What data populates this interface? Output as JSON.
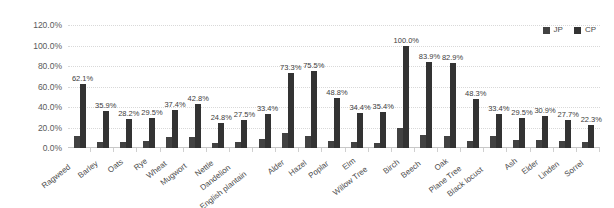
{
  "chart_data": {
    "type": "bar",
    "title": "",
    "subtitle": "",
    "xlabel": "",
    "ylabel": "",
    "ylim": [
      0,
      120
    ],
    "ytick_labels": [
      "120.0%",
      "100.0%",
      "80.0%",
      "60.0%",
      "40.0%",
      "20.0%",
      "0.0%"
    ],
    "ytick_values": [
      120,
      100,
      80,
      60,
      40,
      20,
      0
    ],
    "grid": true,
    "legend_position": "top-right",
    "orientation": "vertical",
    "value_labels_series": "CP",
    "categories": [
      "Ragweed",
      "Barley",
      "Oats",
      "Rye",
      "Wheat",
      "Mugwort",
      "Nettle",
      "Dandelion",
      "English plantain",
      "Alder",
      "Hazel",
      "Poplar",
      "Elm",
      "Willow Tree",
      "Birch",
      "Beech",
      "Oak",
      "Plane Tree",
      "Black locust",
      "Ash",
      "Elder",
      "Linden",
      "Sorrel"
    ],
    "series": [
      {
        "name": "JP",
        "color": "#424242",
        "values": [
          12.0,
          6.2,
          6.0,
          6.8,
          10.4,
          11.2,
          5.0,
          6.0,
          8.5,
          15.0,
          11.5,
          6.5,
          5.8,
          5.2,
          19.8,
          13.0,
          12.2,
          7.2,
          11.6,
          7.5,
          8.0,
          7.0,
          5.5
        ],
        "labels_shown": false
      },
      {
        "name": "CP",
        "color": "#333333",
        "values": [
          62.1,
          35.9,
          28.2,
          29.5,
          37.4,
          42.8,
          24.8,
          27.5,
          33.4,
          73.3,
          75.5,
          48.8,
          34.4,
          35.4,
          100.0,
          83.9,
          82.9,
          48.3,
          33.4,
          29.5,
          30.9,
          27.7,
          22.3
        ],
        "value_labels": [
          "62.1%",
          "35.9%",
          "28.2%",
          "29.5%",
          "37.4%",
          "42.8%",
          "24.8%",
          "27.5%",
          "33.4%",
          "73.3%",
          "75.5%",
          "48.8%",
          "34.4%",
          "35.4%",
          "100.0%",
          "83.9%",
          "82.9%",
          "48.3%",
          "33.4%",
          "29.5%",
          "30.9%",
          "27.7%",
          "22.3%"
        ],
        "labels_shown": true
      }
    ]
  },
  "legend": {
    "entries": [
      {
        "label": "JP",
        "color": "#424242",
        "marker": "square-marker"
      },
      {
        "label": "CP",
        "color": "#333333",
        "marker": "square-marker"
      }
    ]
  }
}
